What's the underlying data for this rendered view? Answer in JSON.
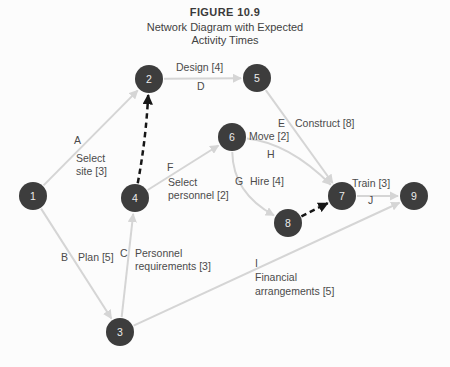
{
  "figure": {
    "kicker": "FIGURE 10.9",
    "title_line1": "Network Diagram with Expected",
    "title_line2": "Activity Times"
  },
  "colors": {
    "background": "#fcfcfc",
    "node_fill": "#3d3d3d",
    "node_text": "#ececec",
    "edge": "#d5d5d5",
    "dummy": "#161616",
    "label_text": "#4b4b4b"
  },
  "diagram": {
    "node_radius": 14,
    "nodes": [
      {
        "id": "1",
        "x": 33,
        "y": 196
      },
      {
        "id": "2",
        "x": 149,
        "y": 79
      },
      {
        "id": "3",
        "x": 120,
        "y": 332
      },
      {
        "id": "4",
        "x": 135,
        "y": 198
      },
      {
        "id": "5",
        "x": 257,
        "y": 78
      },
      {
        "id": "6",
        "x": 232,
        "y": 137
      },
      {
        "id": "7",
        "x": 342,
        "y": 196
      },
      {
        "id": "8",
        "x": 288,
        "y": 223
      },
      {
        "id": "9",
        "x": 414,
        "y": 196
      }
    ],
    "edges": [
      {
        "activity": "A",
        "from": "1",
        "to": "2",
        "style": "solid"
      },
      {
        "activity": "B",
        "from": "1",
        "to": "3",
        "style": "solid"
      },
      {
        "activity": "C",
        "from": "3",
        "to": "4",
        "style": "solid"
      },
      {
        "activity": "D",
        "from": "2",
        "to": "5",
        "style": "solid"
      },
      {
        "activity": "E",
        "from": "5",
        "to": "7",
        "style": "solid"
      },
      {
        "activity": "F",
        "from": "4",
        "to": "6",
        "style": "solid"
      },
      {
        "activity": "G",
        "from": "6",
        "to": "8",
        "style": "solid",
        "curve": [
          233,
          193
        ]
      },
      {
        "activity": "H",
        "from": "6",
        "to": "7",
        "style": "solid",
        "curve": [
          289,
          143
        ]
      },
      {
        "activity": "I",
        "from": "3",
        "to": "9",
        "style": "solid"
      },
      {
        "activity": "J",
        "from": "7",
        "to": "9",
        "style": "solid"
      },
      {
        "activity": "dummy-4-2",
        "from": "4",
        "to": "2",
        "style": "dashed",
        "curve": [
          146,
          139
        ]
      },
      {
        "activity": "dummy-8-7",
        "from": "8",
        "to": "7",
        "style": "dashed"
      }
    ],
    "labels": [
      {
        "name": "design",
        "text": "Design [4]",
        "x": 176,
        "y": 71
      },
      {
        "name": "letter-d",
        "text": "D",
        "x": 197,
        "y": 90
      },
      {
        "name": "letter-a",
        "text": "A",
        "x": 74,
        "y": 144
      },
      {
        "name": "select-site-1",
        "text": "Select",
        "x": 76,
        "y": 162
      },
      {
        "name": "select-site-2",
        "text": "site [3]",
        "x": 76,
        "y": 175
      },
      {
        "name": "letter-f",
        "text": "F",
        "x": 167,
        "y": 171
      },
      {
        "name": "select-personnel-1",
        "text": "Select",
        "x": 168,
        "y": 186
      },
      {
        "name": "select-personnel-2",
        "text": "personnel [2]",
        "x": 168,
        "y": 199
      },
      {
        "name": "letter-e",
        "text": "E",
        "x": 278,
        "y": 127
      },
      {
        "name": "construct",
        "text": "Construct [8]",
        "x": 295,
        "y": 127
      },
      {
        "name": "move",
        "text": "Move [2]",
        "x": 249,
        "y": 140
      },
      {
        "name": "letter-h",
        "text": "H",
        "x": 267,
        "y": 158
      },
      {
        "name": "letter-g",
        "text": "G",
        "x": 235,
        "y": 185
      },
      {
        "name": "hire",
        "text": "Hire [4]",
        "x": 250,
        "y": 185
      },
      {
        "name": "train",
        "text": "Train [3]",
        "x": 352,
        "y": 187
      },
      {
        "name": "letter-j",
        "text": "J",
        "x": 368,
        "y": 204
      },
      {
        "name": "letter-b",
        "text": "B",
        "x": 61,
        "y": 261
      },
      {
        "name": "plan",
        "text": "Plan [5]",
        "x": 78,
        "y": 261
      },
      {
        "name": "letter-c",
        "text": "C",
        "x": 120,
        "y": 257
      },
      {
        "name": "personnel-req-1",
        "text": "Personnel",
        "x": 135,
        "y": 257
      },
      {
        "name": "personnel-req-2",
        "text": "requirements [3]",
        "x": 135,
        "y": 270
      },
      {
        "name": "letter-i",
        "text": "I",
        "x": 255,
        "y": 267
      },
      {
        "name": "financial-1",
        "text": "Financial",
        "x": 255,
        "y": 281
      },
      {
        "name": "financial-2",
        "text": "arrangements [5]",
        "x": 255,
        "y": 295
      }
    ]
  }
}
